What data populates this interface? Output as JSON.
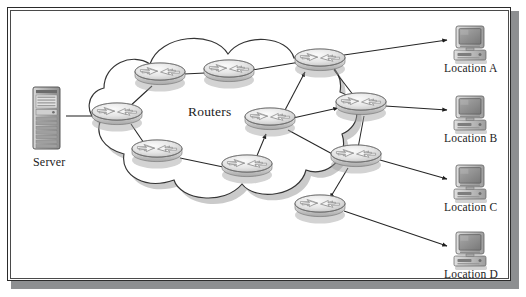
{
  "figure": {
    "background_color": "#ffffff",
    "border_color": "#2b2b2b",
    "shadow_color": "#8d8f91"
  },
  "cloud": {
    "name": "router-cloud",
    "label": "Routers",
    "outline_color": "#3a3a3a",
    "fill_color": "#ffffff",
    "shadow_color": "#9a9a9a"
  },
  "server": {
    "name": "server-tower",
    "label": "Server",
    "body_color": "#b9b9b9",
    "trim_color": "#6e6e6e"
  },
  "locations": [
    {
      "id": "a",
      "label": "Location A",
      "icon": "desktop-computer-icon"
    },
    {
      "id": "b",
      "label": "Location B",
      "icon": "desktop-computer-icon"
    },
    {
      "id": "c",
      "label": "Location C",
      "icon": "desktop-computer-icon"
    },
    {
      "id": "d",
      "label": "Location D",
      "icon": "desktop-computer-icon"
    }
  ],
  "routers": [
    {
      "id": "r1",
      "name": "router-west",
      "x": 117,
      "y": 116
    },
    {
      "id": "r2",
      "name": "router-north-left",
      "x": 160,
      "y": 76
    },
    {
      "id": "r3",
      "name": "router-north-mid",
      "x": 229,
      "y": 73
    },
    {
      "id": "r4",
      "name": "router-north-east",
      "x": 320,
      "y": 62
    },
    {
      "id": "r5",
      "name": "router-center",
      "x": 270,
      "y": 121
    },
    {
      "id": "r6",
      "name": "router-east-upper",
      "x": 361,
      "y": 106
    },
    {
      "id": "r7",
      "name": "router-south-left",
      "x": 157,
      "y": 153
    },
    {
      "id": "r8",
      "name": "router-south-mid",
      "x": 247,
      "y": 168
    },
    {
      "id": "r9",
      "name": "router-east-lower",
      "x": 356,
      "y": 158
    },
    {
      "id": "r10",
      "name": "router-south-east",
      "x": 320,
      "y": 208
    }
  ],
  "links": [
    {
      "from": "server",
      "to": "r1",
      "arrow": true
    },
    {
      "from": "r1",
      "to": "r2",
      "arrow": false
    },
    {
      "from": "r2",
      "to": "r3",
      "arrow": false
    },
    {
      "from": "r3",
      "to": "r4",
      "arrow": true
    },
    {
      "from": "r1",
      "to": "r7",
      "arrow": true
    },
    {
      "from": "r7",
      "to": "r8",
      "arrow": true
    },
    {
      "from": "r8",
      "to": "r5",
      "arrow": true
    },
    {
      "from": "r5",
      "to": "r4",
      "arrow": true
    },
    {
      "from": "r4",
      "to": "r6",
      "arrow": false
    },
    {
      "from": "r5",
      "to": "r6",
      "arrow": true
    },
    {
      "from": "r6",
      "to": "r9",
      "arrow": false
    },
    {
      "from": "r5",
      "to": "r9",
      "arrow": true
    },
    {
      "from": "r9",
      "to": "r10",
      "arrow": true
    },
    {
      "from": "r4",
      "to": "loc_a",
      "arrow": true
    },
    {
      "from": "r6",
      "to": "loc_b",
      "arrow": true
    },
    {
      "from": "r9",
      "to": "loc_c",
      "arrow": true
    },
    {
      "from": "r10",
      "to": "loc_d",
      "arrow": true
    }
  ],
  "colors": {
    "line": "#2c2c2c",
    "router_top": "#ededed",
    "router_side": "#cfcfcf",
    "router_edge": "#7a7a7a",
    "screen": "#8e8e8e",
    "monitor_body": "#c9c9c9"
  }
}
